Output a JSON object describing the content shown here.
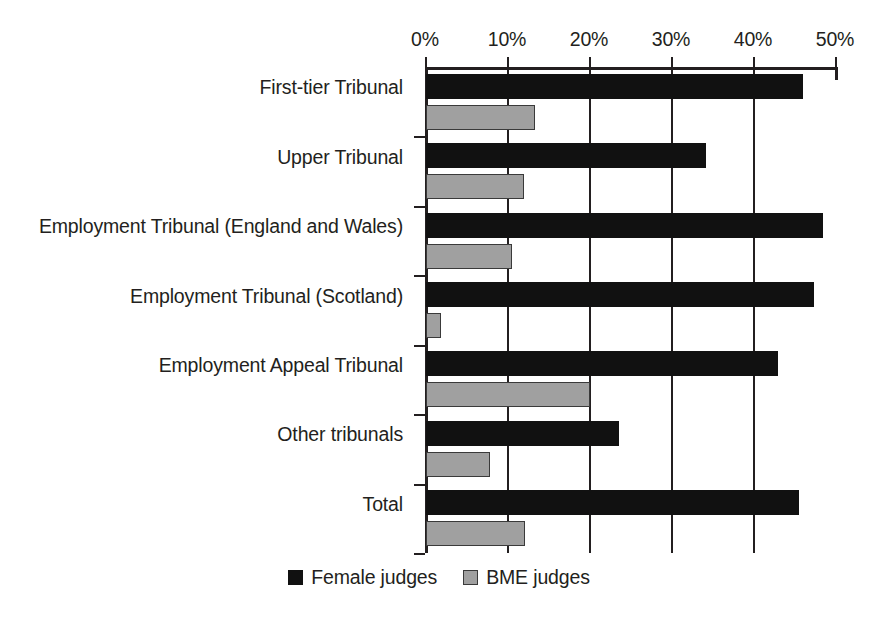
{
  "chart_data": {
    "type": "bar",
    "orientation": "horizontal",
    "title": "",
    "subtitle": "",
    "xlabel": "",
    "ylabel": "",
    "xlim": [
      0,
      50
    ],
    "xticks": [
      0,
      10,
      20,
      30,
      40,
      50
    ],
    "xtick_labels": [
      "0%",
      "10%",
      "20%",
      "30%",
      "40%",
      "50%"
    ],
    "grid": true,
    "grid_axis": "x",
    "legend_position": "bottom-center",
    "categories": [
      "First-tier Tribunal",
      "Upper Tribunal",
      "Employment Tribunal (England and Wales)",
      "Employment Tribunal (Scotland)",
      "Employment Appeal Tribunal",
      "Other tribunals",
      "Total"
    ],
    "series": [
      {
        "name": "Female judges",
        "color": "#111111",
        "values": [
          46.0,
          34.1,
          48.4,
          47.3,
          42.9,
          23.5,
          45.5
        ]
      },
      {
        "name": "BME judges",
        "color": "#a0a0a0",
        "values": [
          13.3,
          12.0,
          10.5,
          1.8,
          20.0,
          7.8,
          12.1
        ]
      }
    ]
  },
  "legend": {
    "items": [
      {
        "label": "Female judges",
        "swatch": "black-square-icon"
      },
      {
        "label": "BME judges",
        "swatch": "grey-square-icon"
      }
    ]
  }
}
